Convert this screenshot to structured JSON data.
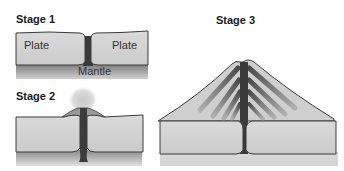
{
  "diagram": {
    "stages": [
      {
        "id": "stage-1",
        "title": "Stage 1",
        "labels": {
          "left_plate": "Plate",
          "right_plate": "Plate",
          "mantle": "Mantle"
        }
      },
      {
        "id": "stage-2",
        "title": "Stage 2"
      },
      {
        "id": "stage-3",
        "title": "Stage 3"
      }
    ],
    "colors": {
      "plate": "#d4d4d4",
      "plate_outline": "#3a3a3a",
      "mantle_dark": "#7a7a7a",
      "mantle_light": "#c8c8c8",
      "magma": "#3c3c3c",
      "cone_light": "#bdbdbd",
      "cone_dark": "#555555",
      "ash": "#d8d8d8"
    }
  }
}
